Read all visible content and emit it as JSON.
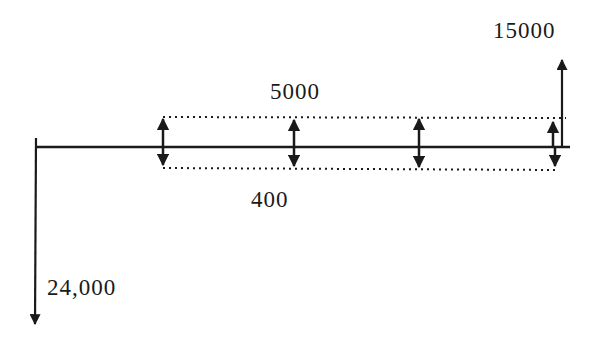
{
  "diagram": {
    "type": "cash-flow-diagram",
    "colors": {
      "stroke": "#1a1a1a",
      "background": "#ffffff"
    },
    "labels": {
      "initial_outflow": "24,000",
      "recurring_inflow": "5000",
      "recurring_outflow": "400",
      "final_inflow": "15000"
    },
    "flows": [
      {
        "position": 0,
        "direction": "down",
        "amount": "24,000"
      },
      {
        "position": 1,
        "direction": "both",
        "up_amount": "5000",
        "down_amount": "400"
      },
      {
        "position": 2,
        "direction": "both",
        "up_amount": "5000",
        "down_amount": "400"
      },
      {
        "position": 3,
        "direction": "both",
        "up_amount": "5000",
        "down_amount": "400"
      },
      {
        "position": 4,
        "direction": "both",
        "up_amount": "5000",
        "down_amount": "400"
      },
      {
        "position": 4,
        "direction": "up",
        "amount": "15000"
      }
    ]
  }
}
